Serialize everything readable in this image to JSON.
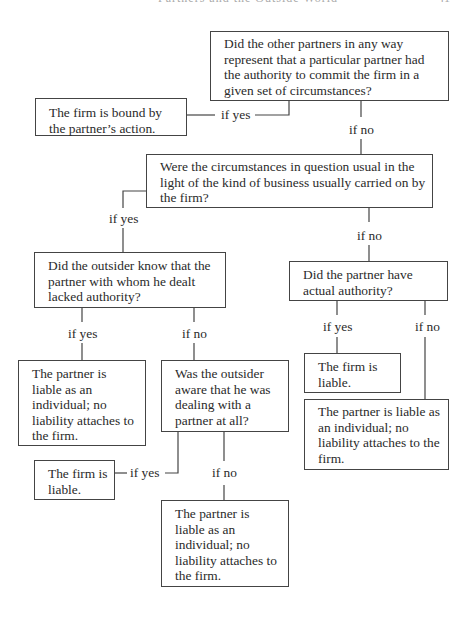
{
  "page": {
    "running_header": "Partners and the Outside World",
    "page_number": "41"
  },
  "nodes": {
    "q1": "Did the other partners in any way represent that a particular partner had the authority to commit the firm in a given set of circumstances?",
    "r1": "The firm is bound by the partner’s action.",
    "q2": "Were the circumstances in question usual in the light of the kind of business usually carried on by the firm?",
    "q3": "Did the outsider know that the partner with whom he dealt lacked authority?",
    "q4": "Did the partner have actual authority?",
    "r2": "The partner is liable as an individual; no liability attaches to the firm.",
    "q5": "Was the outsider aware that he was dealing with a partner at all?",
    "r3": "The firm is liable.",
    "r4": "The partner is liable as an individual; no liability attaches to the firm.",
    "r5": "The firm is liable.",
    "r6": "The partner is liable as an individual; no liability attaches to the firm."
  },
  "edges": {
    "q1_yes": "if yes",
    "q1_no": "if no",
    "q2_yes": "if yes",
    "q2_no": "if no",
    "q3_yes": "if yes",
    "q3_no": "if no",
    "q4_yes": "if yes",
    "q4_no": "if no",
    "q5_yes": "if yes",
    "q5_no": "if no"
  }
}
